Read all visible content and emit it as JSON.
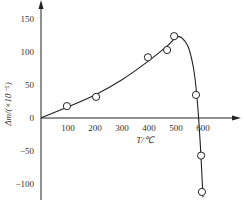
{
  "chart_data": {
    "type": "scatter",
    "title": "",
    "xlabel": "T/℃",
    "ylabel": "Δm/(×10⁻⁵)",
    "xlim": [
      0,
      700
    ],
    "ylim": [
      -120,
      175
    ],
    "x_ticks": [
      100,
      200,
      300,
      400,
      500,
      600
    ],
    "x_tick_labels": [
      "100",
      "200",
      "300",
      "400",
      "500",
      "600"
    ],
    "y_ticks": [
      150,
      100,
      50,
      0,
      -50,
      -100
    ],
    "y_tick_labels": [
      "150",
      "100",
      "50",
      "0",
      "-50",
      "-100"
    ],
    "origin_label": "0",
    "grid": false,
    "legend": "none",
    "series": [
      {
        "name": "measured",
        "marker": "open-circle",
        "points": [
          {
            "x": 96,
            "y": 18
          },
          {
            "x": 204,
            "y": 32
          },
          {
            "x": 396,
            "y": 92
          },
          {
            "x": 467,
            "y": 103
          },
          {
            "x": 493,
            "y": 124
          },
          {
            "x": 574,
            "y": 35
          },
          {
            "x": 593,
            "y": -57
          },
          {
            "x": 596,
            "y": -112
          }
        ]
      },
      {
        "name": "fitted-curve",
        "marker": "none",
        "line": true,
        "points": [
          {
            "x": 0,
            "y": 0
          },
          {
            "x": 100,
            "y": 17
          },
          {
            "x": 200,
            "y": 35
          },
          {
            "x": 300,
            "y": 58
          },
          {
            "x": 400,
            "y": 87
          },
          {
            "x": 470,
            "y": 110
          },
          {
            "x": 500,
            "y": 122
          },
          {
            "x": 520,
            "y": 122
          },
          {
            "x": 545,
            "y": 108
          },
          {
            "x": 565,
            "y": 75
          },
          {
            "x": 578,
            "y": 30
          },
          {
            "x": 590,
            "y": -40
          },
          {
            "x": 600,
            "y": -120
          }
        ]
      }
    ]
  }
}
